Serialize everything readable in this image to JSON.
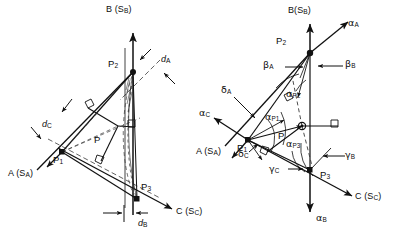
{
  "figure": {
    "stroke_color": "#111111",
    "background_color": "#ffffff",
    "dash_color": "#3a3a3a",
    "panels": [
      {
        "id": "left",
        "name": "distance-construction-panel",
        "labels": {
          "axis_b": "B (S",
          "axis_b_sub": "B",
          "axis_b_close": ")",
          "axis_a": "A (S",
          "axis_a_sub": "A",
          "axis_a_close": ")",
          "axis_c": "C (S",
          "axis_c_sub": "C",
          "axis_c_close": ")",
          "p1": "P",
          "p1_sub": "1",
          "p2": "P",
          "p2_sub": "2",
          "p3": "P",
          "p3_sub": "3",
          "p": "P",
          "d_a": "d",
          "d_a_sub": "A",
          "d_b": "d",
          "d_b_sub": "B",
          "d_c": "d",
          "d_c_sub": "C"
        }
      },
      {
        "id": "right",
        "name": "angle-construction-panel",
        "labels": {
          "axis_b": "B(S",
          "axis_b_sub": "B",
          "axis_b_close": ")",
          "axis_a": "A (S",
          "axis_a_sub": "A",
          "axis_a_close": ")",
          "axis_c": "C (S",
          "axis_c_sub": "C",
          "axis_c_close": ")",
          "p1": "P",
          "p1_sub": "1",
          "p2": "P",
          "p2_sub": "2",
          "p3": "P",
          "p3_sub": "3",
          "p": "P",
          "alpha_a": "α",
          "alpha_a_sub": "A",
          "alpha_b": "α",
          "alpha_b_sub": "B",
          "alpha_c": "α",
          "alpha_c_sub": "C",
          "beta_a": "β",
          "beta_a_sub": "A",
          "beta_b": "β",
          "beta_b_sub": "B",
          "gamma_b": "γ",
          "gamma_b_sub": "B",
          "gamma_c": "γ",
          "gamma_c_sub": "C",
          "delta_a": "δ",
          "delta_a_sub": "A",
          "delta_c": "δ",
          "delta_c_sub": "C",
          "alpha_p1": "α",
          "alpha_p1_sub": "P1",
          "alpha_p2": "α",
          "alpha_p2_sub": "P2",
          "alpha_p3": "α",
          "alpha_p3_sub": "P3"
        }
      }
    ]
  }
}
